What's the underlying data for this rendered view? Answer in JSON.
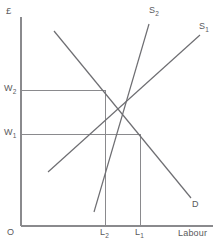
{
  "figure": {
    "title_visible": false,
    "axes": {
      "y_axis_label": "£",
      "x_axis_label": "Labour",
      "origin_label": "O"
    },
    "curve_labels": {
      "supply_1": "S",
      "supply_1_sub": "1",
      "supply_2": "S",
      "supply_2_sub": "2",
      "demand": "D"
    },
    "tick_labels": {
      "wage_high": "W",
      "wage_high_sub": "2",
      "wage_low": "W",
      "wage_low_sub": "1",
      "labour_low": "L",
      "labour_low_sub": "2",
      "labour_high": "L",
      "labour_high_sub": "1"
    },
    "colors": {
      "axis": "#8a8a8d",
      "curve": "#6e6e72",
      "guide": "#8a8a8d",
      "text": "#59595b",
      "background": "#ffffff"
    }
  },
  "chart_data": {
    "type": "line",
    "title": "",
    "subtitle": "",
    "xlabel": "Labour",
    "ylabel": "£",
    "grid": false,
    "legend": "inline-curve-end-labels",
    "xlim": [
      0,
      214
    ],
    "ylim": [
      0,
      243
    ],
    "axis_note": "Schematic labour market diagram; axes are unscaled (no numeric ticks).",
    "series": [
      {
        "name": "D",
        "role": "demand",
        "slope": "negative",
        "points": [
          [
            54,
            31
          ],
          [
            191,
            198
          ]
        ],
        "label_position": [
          192,
          200
        ]
      },
      {
        "name": "S1",
        "role": "supply-original",
        "slope": "positive",
        "points": [
          [
            48,
            172
          ],
          [
            200,
            35
          ]
        ],
        "label_position": [
          199,
          22
        ]
      },
      {
        "name": "S2",
        "role": "supply-shifted-left",
        "slope": "positive",
        "points": [
          [
            94,
            212
          ],
          [
            149,
            24
          ]
        ],
        "label_position": [
          149,
          6
        ]
      }
    ],
    "equilibria": [
      {
        "name": "initial",
        "wage_label": "W1",
        "labour_label": "L1",
        "point": [
          140,
          134
        ],
        "curves": [
          "D",
          "S1"
        ]
      },
      {
        "name": "after-supply-shift",
        "wage_label": "W2",
        "labour_label": "L2",
        "point": [
          105,
          90
        ],
        "curves": [
          "D",
          "S2"
        ]
      }
    ],
    "guide_lines": [
      {
        "name": "W2-horizontal",
        "from": [
          21,
          90
        ],
        "to": [
          105,
          90
        ]
      },
      {
        "name": "W1-horizontal",
        "from": [
          21,
          134
        ],
        "to": [
          140,
          134
        ]
      },
      {
        "name": "L2-vertical",
        "from": [
          105,
          90
        ],
        "to": [
          105,
          226
        ]
      },
      {
        "name": "L1-vertical",
        "from": [
          140,
          134
        ],
        "to": [
          140,
          226
        ]
      }
    ],
    "axis_lines": [
      {
        "name": "y-axis",
        "from": [
          21,
          17
        ],
        "to": [
          21,
          226
        ]
      },
      {
        "name": "x-axis",
        "from": [
          21,
          226
        ],
        "to": [
          213,
          226
        ]
      }
    ],
    "interpretation": "A leftward shift of labour supply from S1 to S2 raises the wage from W1 to W2 and reduces employment from L1 to L2."
  }
}
